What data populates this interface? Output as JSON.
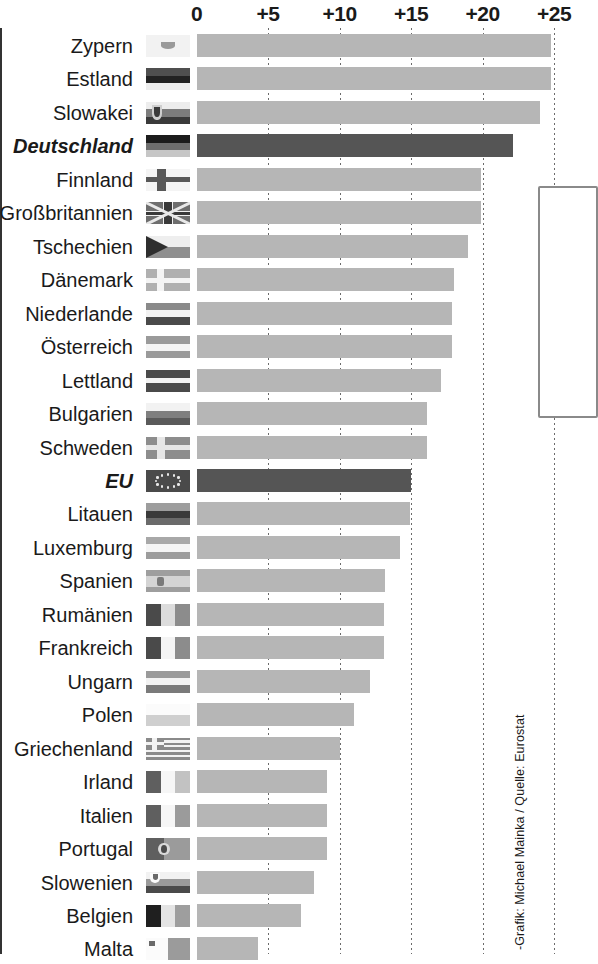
{
  "chart_data": {
    "type": "bar",
    "orientation": "horizontal",
    "title": "",
    "xlabel": "",
    "ylabel": "",
    "xlim": [
      0,
      24.7
    ],
    "grid": true,
    "legend": false,
    "tick_labels": [
      "0",
      "+5",
      "+10",
      "+15",
      "+20",
      "+25"
    ],
    "tick_values": [
      0,
      5,
      10,
      15,
      20,
      25
    ],
    "categories": [
      "Zypern",
      "Estland",
      "Slowakei",
      "Deutschland",
      "Finnland",
      "Großbritannien",
      "Tschechien",
      "Dänemark",
      "Niederlande",
      "Österreich",
      "Lettland",
      "Bulgarien",
      "Schweden",
      "EU",
      "Litauen",
      "Luxemburg",
      "Spanien",
      "Rumänien",
      "Frankreich",
      "Ungarn",
      "Polen",
      "Griechenland",
      "Irland",
      "Italien",
      "Portugal",
      "Slowenien",
      "Belgien",
      "Malta"
    ],
    "values": [
      24.8,
      24.8,
      24.0,
      22.1,
      19.9,
      19.9,
      19.0,
      18.0,
      17.9,
      17.9,
      17.1,
      16.1,
      16.1,
      15.0,
      14.9,
      14.2,
      13.2,
      13.1,
      13.1,
      12.1,
      11.0,
      10.0,
      9.1,
      9.1,
      9.1,
      8.2,
      7.3,
      4.3
    ],
    "truncated_bars": [
      "Zypern",
      "Estland",
      "Malta"
    ],
    "highlighted": [
      "Deutschland",
      "EU"
    ],
    "colors": {
      "bar": "#b6b6b6",
      "bar_highlight": "#555555",
      "axis": "#333333",
      "grid": "#6b6b6b",
      "text": "#1a1a1a"
    }
  },
  "rows": [
    {
      "label": "Zypern",
      "value": 24.8,
      "flag": "cyprus-flag"
    },
    {
      "label": "Estland",
      "value": 24.8,
      "flag": "estonia-flag"
    },
    {
      "label": "Slowakei",
      "value": 24.0,
      "flag": "slovakia-flag"
    },
    {
      "label": "Deutschland",
      "value": 22.1,
      "flag": "germany-flag"
    },
    {
      "label": "Finnland",
      "value": 19.9,
      "flag": "finland-flag"
    },
    {
      "label": "Großbritannien",
      "value": 19.9,
      "flag": "united-kingdom-flag"
    },
    {
      "label": "Tschechien",
      "value": 19.0,
      "flag": "czechia-flag"
    },
    {
      "label": "Dänemark",
      "value": 18.0,
      "flag": "denmark-flag"
    },
    {
      "label": "Niederlande",
      "value": 17.9,
      "flag": "netherlands-flag"
    },
    {
      "label": "Österreich",
      "value": 17.9,
      "flag": "austria-flag"
    },
    {
      "label": "Lettland",
      "value": 17.1,
      "flag": "latvia-flag"
    },
    {
      "label": "Bulgarien",
      "value": 16.1,
      "flag": "bulgaria-flag"
    },
    {
      "label": "Schweden",
      "value": 16.1,
      "flag": "sweden-flag"
    },
    {
      "label": "EU",
      "value": 15.0,
      "flag": "european-union-flag"
    },
    {
      "label": "Litauen",
      "value": 14.9,
      "flag": "lithuania-flag"
    },
    {
      "label": "Luxemburg",
      "value": 14.2,
      "flag": "luxembourg-flag"
    },
    {
      "label": "Spanien",
      "value": 13.2,
      "flag": "spain-flag"
    },
    {
      "label": "Rumänien",
      "value": 13.1,
      "flag": "romania-flag"
    },
    {
      "label": "Frankreich",
      "value": 13.1,
      "flag": "france-flag"
    },
    {
      "label": "Ungarn",
      "value": 12.1,
      "flag": "hungary-flag"
    },
    {
      "label": "Polen",
      "value": 11.0,
      "flag": "poland-flag"
    },
    {
      "label": "Griechenland",
      "value": 10.0,
      "flag": "greece-flag"
    },
    {
      "label": "Irland",
      "value": 9.1,
      "flag": "ireland-flag"
    },
    {
      "label": "Italien",
      "value": 9.1,
      "flag": "italy-flag"
    },
    {
      "label": "Portugal",
      "value": 9.1,
      "flag": "portugal-flag"
    },
    {
      "label": "Slowenien",
      "value": 8.2,
      "flag": "slovenia-flag"
    },
    {
      "label": "Belgien",
      "value": 7.3,
      "flag": "belgium-flag"
    },
    {
      "label": "Malta",
      "value": 4.3,
      "flag": "malta-flag"
    }
  ],
  "credit": {
    "text": "-Grafik: Michael Mainka / Quelle: Eurostat"
  }
}
